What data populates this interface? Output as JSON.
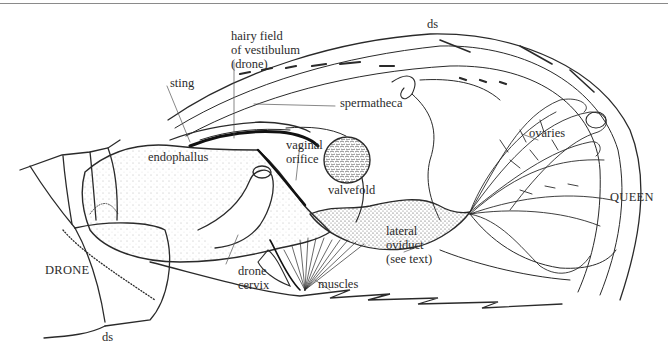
{
  "figure": {
    "type": "anatomical line drawing",
    "labels": {
      "hairy_field": "hairy field\nof vestibulum\n(drone)",
      "sting": "sting",
      "ds_top": "ds",
      "spermatheca": "spermatheca",
      "ovaries": "ovaries",
      "endophallus": "endophallus",
      "vaginal_orifice": "vaginal\norifice",
      "valvefold": "valvefold",
      "queen": "QUEEN",
      "drone": "DRONE",
      "drone_cervix": "drone\ncervix",
      "muscles": "muscles",
      "lateral_oviduct": "lateral\noviduct\n(see text)",
      "ds_bottom": "ds"
    }
  }
}
